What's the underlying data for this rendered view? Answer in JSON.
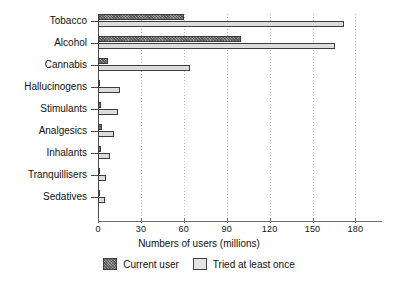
{
  "chart_data": {
    "type": "bar",
    "orientation": "horizontal",
    "title": "",
    "xlabel": "Numbers of users (millions)",
    "ylabel": "",
    "xlim": [
      0,
      198
    ],
    "xticks": [
      0,
      30,
      60,
      90,
      120,
      150,
      180
    ],
    "xticklabels": [
      "0",
      "30",
      "60",
      "90",
      "120",
      "150",
      "180"
    ],
    "grid": true,
    "grid_axis": "x",
    "legend_position": "bottom-center",
    "categories": [
      "Tobacco",
      "Alcohol",
      "Cannabis",
      "Hallucinogens",
      "Stimulants",
      "Analgesics",
      "Inhalants",
      "Tranquillisers",
      "Sedatives"
    ],
    "series": [
      {
        "name": "Current user",
        "values": [
          60,
          100,
          7,
          1,
          2,
          3,
          2,
          1,
          1
        ]
      },
      {
        "name": "Tried at least once",
        "values": [
          172,
          166,
          64.5,
          15.5,
          14,
          11.5,
          8.5,
          5.5,
          5
        ]
      }
    ]
  },
  "legend": {
    "entries": [
      {
        "label": "Current user",
        "style": "current"
      },
      {
        "label": "Tried at least once",
        "style": "tried"
      }
    ]
  }
}
